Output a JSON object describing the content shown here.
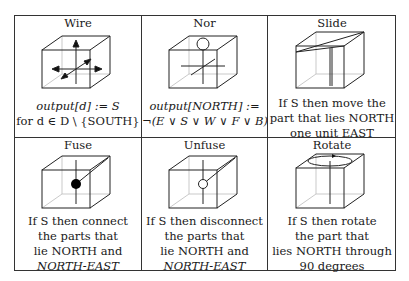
{
  "table": {
    "cells": [
      {
        "id": "wire",
        "title": "Wire",
        "icon": "cube-with-four-arrows-icon",
        "caption_lines": [
          "output[d] := S",
          "for d ∈ D \\ {SOUTH}"
        ]
      },
      {
        "id": "nor",
        "title": "Nor",
        "icon": "cube-with-nor-gate-icon",
        "caption_lines": [
          "output[NORTH] :=",
          "¬(E ∨ S ∨ W ∨ F ∨ B)"
        ]
      },
      {
        "id": "slide",
        "title": "Slide",
        "icon": "cube-with-slide-plane-icon",
        "caption_lines": [
          "If S then move the",
          "part that lies NORTH",
          "one unit EAST"
        ]
      },
      {
        "id": "fuse",
        "title": "Fuse",
        "icon": "cube-with-filled-joint-icon",
        "caption_lines": [
          "If S then connect",
          "the parts that",
          "lie NORTH and",
          "NORTH-EAST"
        ]
      },
      {
        "id": "unfuse",
        "title": "Unfuse",
        "icon": "cube-with-open-joint-icon",
        "caption_lines": [
          "If S then disconnect",
          "the parts that",
          "lie NORTH and",
          "NORTH-EAST"
        ]
      },
      {
        "id": "rotate",
        "title": "Rotate",
        "icon": "cube-with-rotation-ring-icon",
        "caption_lines": [
          "If S then rotate",
          "the part that",
          "lies NORTH through",
          "90 degrees"
        ]
      }
    ]
  },
  "colors": {
    "line": "#333333",
    "hidden_edge": "#bbbbbb",
    "background": "#ffffff"
  }
}
